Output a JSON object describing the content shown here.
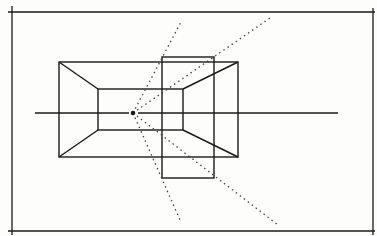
{
  "diagram": {
    "title": "",
    "colors": {
      "background": "#fdfdfb",
      "ink": "#1a1a1a"
    },
    "frame": {
      "left_x": 12,
      "right_x": 373,
      "top_y": 12,
      "bottom_y": 231
    },
    "outer_rect": {
      "x1": 59,
      "y1": 62,
      "x2": 238,
      "y2": 157
    },
    "inner_rect": {
      "x1": 98,
      "y1": 89,
      "x2": 183,
      "y2": 130
    },
    "overlay_rect": {
      "x1": 162,
      "y1": 57,
      "x2": 214,
      "y2": 178
    },
    "horizon": {
      "x1": 35,
      "x2": 338,
      "y": 113
    },
    "eye_point": {
      "x": 133,
      "y": 113
    },
    "sight_lines": [
      {
        "x2": 182,
        "y2": 20
      },
      {
        "x2": 270,
        "y2": 18
      },
      {
        "x2": 180,
        "y2": 220
      },
      {
        "x2": 278,
        "y2": 225
      }
    ]
  }
}
